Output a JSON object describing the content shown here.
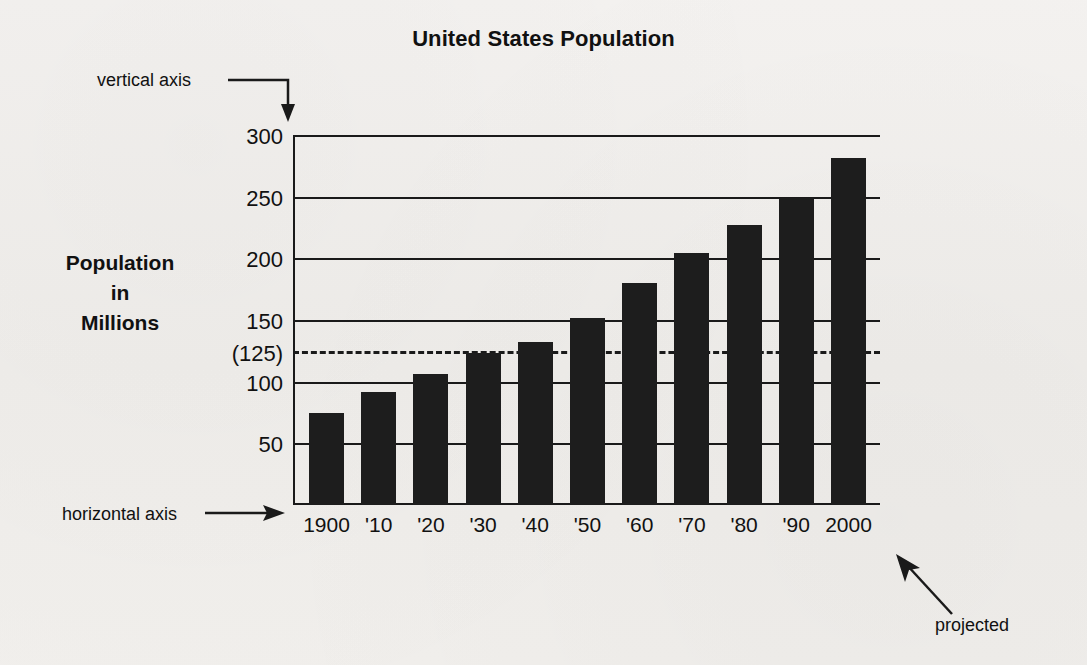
{
  "chart_data": {
    "type": "bar",
    "title": "United States Population",
    "xlabel": "Years",
    "ylabel": "Population in Millions",
    "categories": [
      "1900",
      "'10",
      "'20",
      "'30",
      "'40",
      "'50",
      "'60",
      "'70",
      "'80",
      "'90",
      "2000"
    ],
    "values": [
      75,
      92,
      106,
      123,
      132,
      152,
      180,
      204,
      227,
      249,
      281
    ],
    "ylim": [
      0,
      300
    ],
    "yticks": [
      50,
      100,
      125,
      150,
      200,
      250,
      300
    ],
    "ytick_labels": [
      "50",
      "100",
      "(125)",
      "150",
      "200",
      "250",
      "300"
    ],
    "grid": true,
    "legend": false,
    "bar_color": "#1d1d1d",
    "reference_line": {
      "value": 125,
      "label": "(125)",
      "style": "dashed"
    },
    "annotations": [
      {
        "text": "vertical axis",
        "points_to": "y-axis"
      },
      {
        "text": "horizontal axis",
        "points_to": "x-axis"
      },
      {
        "text": "projected",
        "points_to": "2000 bar"
      }
    ]
  },
  "title": "United States Population",
  "y_axis": {
    "title_lines": [
      "Population",
      "in",
      "Millions"
    ],
    "ticks": [
      {
        "value": 300,
        "label": "300"
      },
      {
        "value": 250,
        "label": "250"
      },
      {
        "value": 200,
        "label": "200"
      },
      {
        "value": 150,
        "label": "150"
      },
      {
        "value": 125,
        "label": "(125)"
      },
      {
        "value": 100,
        "label": "100"
      },
      {
        "value": 50,
        "label": "50"
      }
    ]
  },
  "x_axis": {
    "title": "Years",
    "labels": [
      "1900",
      "'10",
      "'20",
      "'30",
      "'40",
      "'50",
      "'60",
      "'70",
      "'80",
      "'90",
      "2000"
    ]
  },
  "bars": [
    {
      "year": "1900",
      "value": 75
    },
    {
      "year": "'10",
      "value": 92
    },
    {
      "year": "'20",
      "value": 106
    },
    {
      "year": "'30",
      "value": 123
    },
    {
      "year": "'40",
      "value": 132
    },
    {
      "year": "'50",
      "value": 152
    },
    {
      "year": "'60",
      "value": 180
    },
    {
      "year": "'70",
      "value": 204
    },
    {
      "year": "'80",
      "value": 227
    },
    {
      "year": "'90",
      "value": 249
    },
    {
      "year": "2000",
      "value": 281
    }
  ],
  "callouts": {
    "vertical_axis": "vertical axis",
    "horizontal_axis": "horizontal axis",
    "projected": "projected"
  },
  "colors": {
    "bar": "#1d1d1d",
    "ink": "#1a1a1a",
    "paper": "#f2f0ee"
  }
}
